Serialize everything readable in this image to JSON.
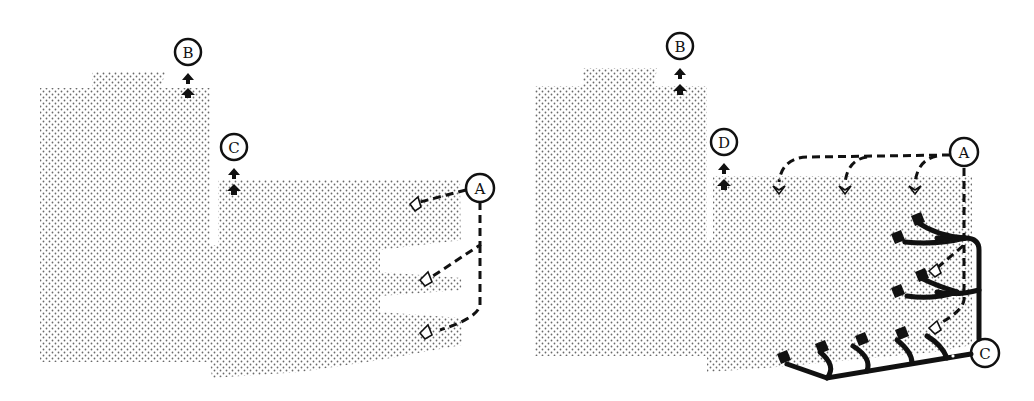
{
  "colors": {
    "ink": "#111111",
    "dot": "#6a6a6a",
    "background": "#ffffff"
  },
  "left_panel": {
    "labels": {
      "a": "A",
      "b": "B",
      "c": "C"
    },
    "description": "Stippled block region with two stacked up-arrows at B and C; dashed arrows from A pointing to three open arrowheads"
  },
  "right_panel": {
    "labels": {
      "a": "A",
      "b": "B",
      "c": "C",
      "d": "D"
    },
    "description": "Stippled block region; A dashed branches to three open arrowheads along top edge and two along right edge; C solid branching tree with filled arrowheads"
  }
}
